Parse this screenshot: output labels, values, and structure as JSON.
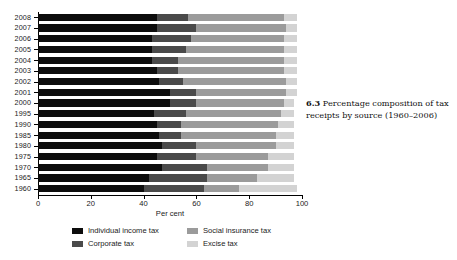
{
  "figure": {
    "caption_number": "6.3",
    "caption_text": "Percentage composition of tax receipts by source (1960–2006)"
  },
  "axes": {
    "x_title": "Per cent",
    "x_ticks": [
      "0",
      "20",
      "40",
      "60",
      "80",
      "100"
    ],
    "y_ticks": [
      "2008",
      "2007",
      "2006",
      "2005",
      "2004",
      "2003",
      "2002",
      "2001",
      "2000",
      "1995",
      "1990",
      "1985",
      "1980",
      "1975",
      "1970",
      "1965",
      "1960"
    ]
  },
  "legend": {
    "items": [
      {
        "label": "Individual income tax",
        "color": "#0d0d0d"
      },
      {
        "label": "Corporate tax",
        "color": "#4a4a4a"
      },
      {
        "label": "Social insurance tax",
        "color": "#9b9b9b"
      },
      {
        "label": "Excise tax",
        "color": "#d3d3d3"
      }
    ]
  },
  "chart_data": {
    "type": "bar",
    "orientation": "horizontal",
    "stacked": true,
    "title": "Percentage composition of tax receipts by source (1960–2006)",
    "xlabel": "Per cent",
    "ylabel": "",
    "xlim": [
      0,
      100
    ],
    "grid": false,
    "legend_position": "bottom",
    "categories": [
      "2008",
      "2007",
      "2006",
      "2005",
      "2004",
      "2003",
      "2002",
      "2001",
      "2000",
      "1995",
      "1990",
      "1985",
      "1980",
      "1975",
      "1970",
      "1965",
      "1960"
    ],
    "series": [
      {
        "name": "Individual income tax",
        "color": "#0d0d0d",
        "values": [
          45,
          45,
          43,
          43,
          43,
          45,
          46,
          50,
          50,
          44,
          45,
          46,
          47,
          45,
          47,
          42,
          40
        ]
      },
      {
        "name": "Corporate tax",
        "color": "#4a4a4a",
        "values": [
          12,
          15,
          15,
          13,
          10,
          8,
          9,
          10,
          10,
          12,
          9,
          8,
          13,
          15,
          17,
          22,
          23
        ]
      },
      {
        "name": "Social insurance tax",
        "color": "#9b9b9b",
        "values": [
          36,
          34,
          35,
          37,
          40,
          40,
          39,
          34,
          33,
          36,
          37,
          36,
          30,
          27,
          23,
          19,
          13
        ]
      },
      {
        "name": "Excise tax",
        "color": "#d3d3d3",
        "values": [
          5,
          4,
          5,
          5,
          5,
          5,
          4,
          4,
          4,
          5,
          6,
          7,
          7,
          10,
          10,
          14,
          22
        ]
      }
    ]
  }
}
